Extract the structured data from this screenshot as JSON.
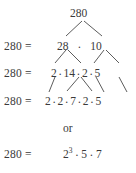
{
  "figure": {
    "title_number": "280",
    "connective_word": "or",
    "multiplication_dot": "·",
    "equals_label": "280  =",
    "colors": {
      "background": "#ffffff",
      "text": "#3a3a3a",
      "branch_line": "#4a4a4a"
    },
    "rows": [
      {
        "name": "root-row",
        "equals_label": "",
        "terms": [
          "280"
        ]
      },
      {
        "name": "row-1",
        "equals_label": "280  =",
        "terms": [
          "28",
          "10"
        ]
      },
      {
        "name": "row-2",
        "equals_label": "280  =",
        "terms": [
          "2",
          "14",
          "2",
          "5"
        ]
      },
      {
        "name": "row-3",
        "equals_label": "280  =",
        "terms": [
          "2",
          "2",
          "7",
          "2",
          "5"
        ]
      },
      {
        "name": "row-4",
        "equals_label": "280  =",
        "terms": [
          "2",
          "3",
          "5",
          "7"
        ],
        "base": "2",
        "exponent": "3",
        "factor_b": "5",
        "factor_c": "7"
      }
    ]
  }
}
